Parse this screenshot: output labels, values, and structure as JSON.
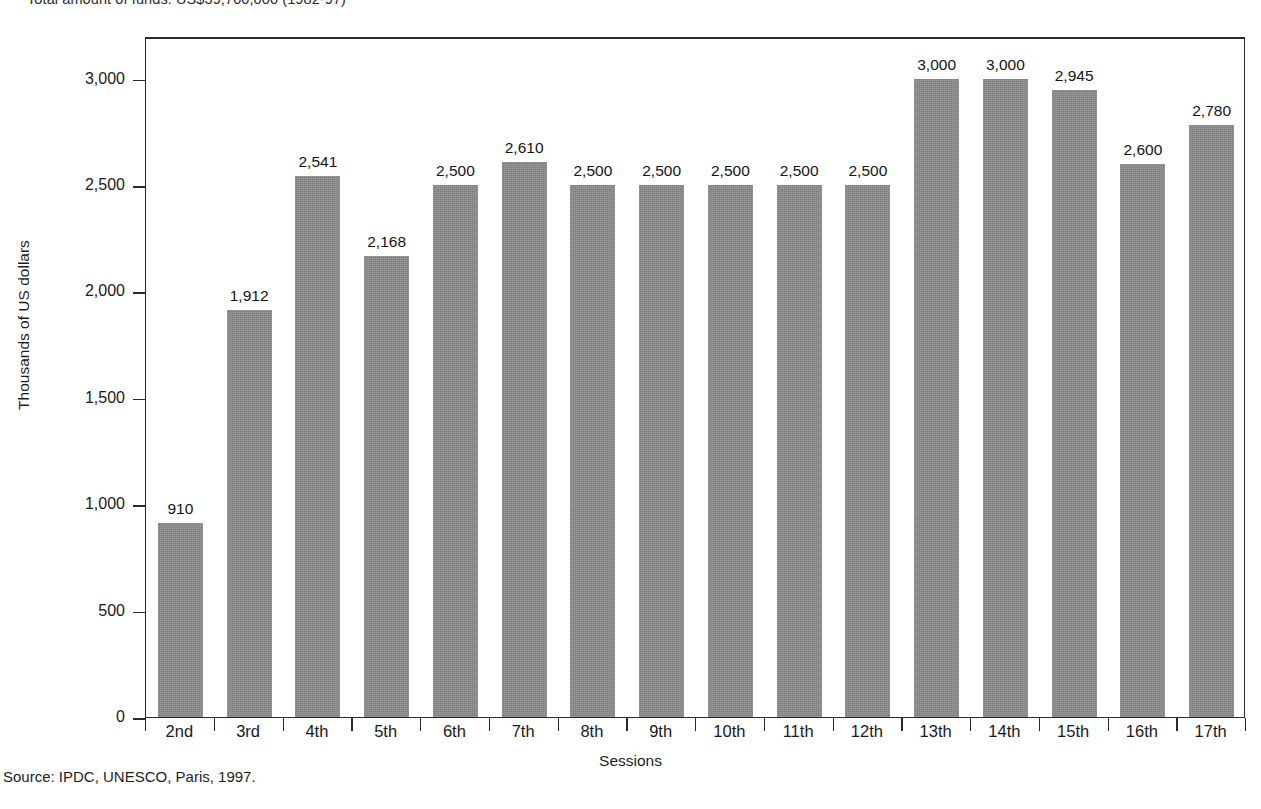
{
  "figure": {
    "top_caption": "Total amount of funds: US$39,700,000 (1982-97)",
    "source_note": "Source: IPDC, UNESCO, Paris, 1997."
  },
  "chart_data": {
    "type": "bar",
    "title": "Total amount of funds: US$39,700,000 (1982-97)",
    "xlabel": "Sessions",
    "ylabel": "Thousands of US dollars",
    "categories": [
      "2nd",
      "3rd",
      "4th",
      "5th",
      "6th",
      "7th",
      "8th",
      "9th",
      "10th",
      "11th",
      "12th",
      "13th",
      "14th",
      "15th",
      "16th",
      "17th"
    ],
    "values": [
      910,
      1912,
      2541,
      2168,
      2500,
      2610,
      2500,
      2500,
      2500,
      2500,
      2500,
      3000,
      3000,
      2945,
      2600,
      2780
    ],
    "value_labels": [
      "910",
      "1,912",
      "2,541",
      "2,168",
      "2,500",
      "2,610",
      "2,500",
      "2,500",
      "2,500",
      "2,500",
      "2,500",
      "3,000",
      "3,000",
      "2,945",
      "2,600",
      "2,780"
    ],
    "ylim": [
      0,
      3200
    ],
    "yticks": [
      0,
      500,
      1000,
      1500,
      2000,
      2500,
      3000
    ],
    "ytick_labels": [
      "0",
      "500",
      "1,000",
      "1,500",
      "2,000",
      "2,500",
      "3,000"
    ],
    "grid": false,
    "legend": false,
    "bar_color": "#8d8d8d",
    "frame_color": "#2a2a2a"
  }
}
